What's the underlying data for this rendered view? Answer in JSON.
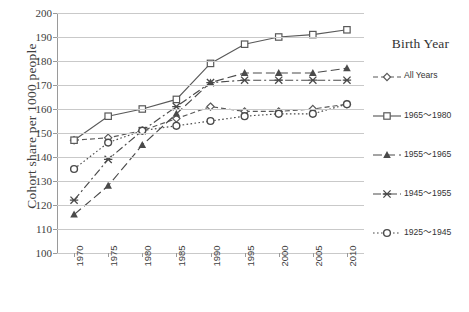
{
  "chart_data": {
    "type": "line",
    "title": "",
    "xlabel": "",
    "ylabel": "Cohort share per 1000 people",
    "categories": [
      "1970",
      "1975",
      "1980",
      "1985",
      "1990",
      "1995",
      "2000",
      "2005",
      "2010"
    ],
    "ylim": [
      100,
      200
    ],
    "ytick_labels": [
      "200",
      "190",
      "180",
      "170",
      "160",
      "150",
      "140",
      "130",
      "120",
      "110",
      "100"
    ],
    "yticks": [
      200,
      190,
      180,
      170,
      160,
      150,
      140,
      130,
      120,
      110,
      100
    ],
    "grid": true,
    "legend_position": "right",
    "legend_title": "Birth Year",
    "series": [
      {
        "name": "All Years",
        "marker": "diamond",
        "dash": "dashed",
        "color": "#595959",
        "values": [
          147,
          148,
          151,
          156,
          161,
          159,
          159,
          160,
          162
        ]
      },
      {
        "name": "1965～1980",
        "marker": "square",
        "dash": "solid",
        "color": "#595959",
        "values": [
          147,
          157,
          160,
          164,
          179,
          187,
          190,
          191,
          193
        ]
      },
      {
        "name": "1955～1965",
        "marker": "triangle",
        "dash": "long-dash",
        "color": "#4a4a4a",
        "values": [
          116,
          128,
          145,
          158,
          171,
          175,
          175,
          175,
          177
        ]
      },
      {
        "name": "1945～1955",
        "marker": "x",
        "dash": "dash-dot",
        "color": "#4a4a4a",
        "values": [
          122,
          139,
          151,
          161,
          171,
          172,
          172,
          172,
          172
        ]
      },
      {
        "name": "1925～1945",
        "marker": "circle",
        "dash": "dotted",
        "color": "#4a4a4a",
        "values": [
          135,
          146,
          151,
          153,
          155,
          157,
          158,
          158,
          162
        ]
      }
    ]
  },
  "axis": {
    "y_title": "Cohort share per 1000 people"
  },
  "legend": {
    "title": "Birth Year",
    "items": [
      {
        "label": "All Years"
      },
      {
        "label": "1965～1980"
      },
      {
        "label": "1955～1965"
      },
      {
        "label": "1945～1955"
      },
      {
        "label": "1925～1945"
      }
    ]
  }
}
